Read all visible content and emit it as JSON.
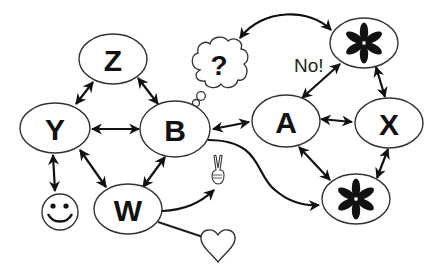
{
  "diagram": {
    "title": "",
    "colors": {
      "stroke": "#111111",
      "fill": "#ffffff",
      "background": "#ffffff"
    },
    "nodes": [
      {
        "id": "Z",
        "label": "Z",
        "shape": "ellipse"
      },
      {
        "id": "Y",
        "label": "Y",
        "shape": "ellipse"
      },
      {
        "id": "B",
        "label": "B",
        "shape": "ellipse"
      },
      {
        "id": "W",
        "label": "W",
        "shape": "ellipse"
      },
      {
        "id": "A",
        "label": "A",
        "shape": "ellipse"
      },
      {
        "id": "X",
        "label": "X",
        "shape": "ellipse"
      },
      {
        "id": "star_top",
        "label": "asterisk",
        "shape": "ellipse",
        "icon": "asterisk-icon"
      },
      {
        "id": "star_bottom",
        "label": "asterisk",
        "shape": "ellipse",
        "icon": "asterisk-icon"
      },
      {
        "id": "smiley",
        "label": "smiley",
        "shape": "circle",
        "icon": "smiley-icon"
      },
      {
        "id": "thought",
        "label": "?",
        "shape": "thought-bubble"
      },
      {
        "id": "victory",
        "label": "victory hand",
        "icon": "victory-hand-icon"
      },
      {
        "id": "heart",
        "label": "heart",
        "icon": "heart-icon"
      }
    ],
    "edges": [
      {
        "from": "Z",
        "to": "Y",
        "type": "bidirectional"
      },
      {
        "from": "Z",
        "to": "B",
        "type": "bidirectional"
      },
      {
        "from": "Y",
        "to": "B",
        "type": "bidirectional"
      },
      {
        "from": "Y",
        "to": "W",
        "type": "bidirectional"
      },
      {
        "from": "Y",
        "to": "smiley",
        "type": "bidirectional"
      },
      {
        "from": "B",
        "to": "W",
        "type": "bidirectional"
      },
      {
        "from": "B",
        "to": "A",
        "type": "bidirectional"
      },
      {
        "from": "B",
        "to": "thought",
        "type": "attached-bubble"
      },
      {
        "from": "B",
        "to": "star_bottom",
        "type": "directed-curve"
      },
      {
        "from": "thought",
        "to": "star_top",
        "type": "bidirectional-arc"
      },
      {
        "from": "A",
        "to": "star_top",
        "type": "bidirectional",
        "label": "No!"
      },
      {
        "from": "A",
        "to": "X",
        "type": "bidirectional"
      },
      {
        "from": "A",
        "to": "star_bottom",
        "type": "bidirectional"
      },
      {
        "from": "X",
        "to": "star_top",
        "type": "bidirectional"
      },
      {
        "from": "X",
        "to": "star_bottom",
        "type": "bidirectional"
      },
      {
        "from": "W",
        "to": "victory",
        "type": "directed-curve"
      },
      {
        "from": "W",
        "to": "heart",
        "type": "line"
      }
    ],
    "annotations": {
      "no_label": "No!",
      "question": "?"
    }
  }
}
